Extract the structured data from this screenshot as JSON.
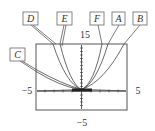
{
  "figure": {
    "window": {
      "xmin": "-5",
      "xmax": "5",
      "ymin": "-5",
      "ymax": "15"
    },
    "tick_labels": {
      "ymax": "15",
      "xmin": "−5",
      "xmax": "5",
      "ymin": "−5"
    },
    "curve_labels": [
      "D",
      "E",
      "F",
      "A",
      "B",
      "C"
    ],
    "colors": {
      "frame": "#555555",
      "curve": "#444444",
      "label_box": "#666666"
    }
  }
}
